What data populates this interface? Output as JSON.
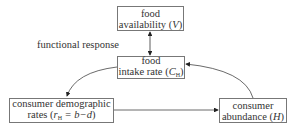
{
  "diagram": {
    "nodes": [
      {
        "id": "food-availability",
        "line1": "food",
        "line2_text": "availability (",
        "line2_var": "V",
        "line2_end": ")"
      },
      {
        "id": "food-intake-rate",
        "line1": "food",
        "line2_text": "intake rate (",
        "line2_var": "C",
        "line2_sub": "H",
        "line2_end": ")"
      },
      {
        "id": "consumer-demographic-rates",
        "line1": "consumer demographic",
        "line2_text": "rates (",
        "line2_var": "r",
        "line2_sub": "H",
        "line2_eq": " = b−d",
        "line2_end": ")"
      },
      {
        "id": "consumer-abundance",
        "line1": "consumer",
        "line2_text": "abundance (",
        "line2_var": "H",
        "line2_end": ")"
      }
    ],
    "edge_label": "functional response",
    "edges": [
      {
        "from": "food-availability",
        "to": "food-intake-rate",
        "type": "bidirectional",
        "label": "functional response"
      },
      {
        "from": "food-intake-rate",
        "to": "consumer-demographic-rates",
        "type": "curved"
      },
      {
        "from": "consumer-demographic-rates",
        "to": "consumer-abundance",
        "type": "straight"
      },
      {
        "from": "consumer-abundance",
        "to": "food-intake-rate",
        "type": "curved"
      }
    ]
  }
}
